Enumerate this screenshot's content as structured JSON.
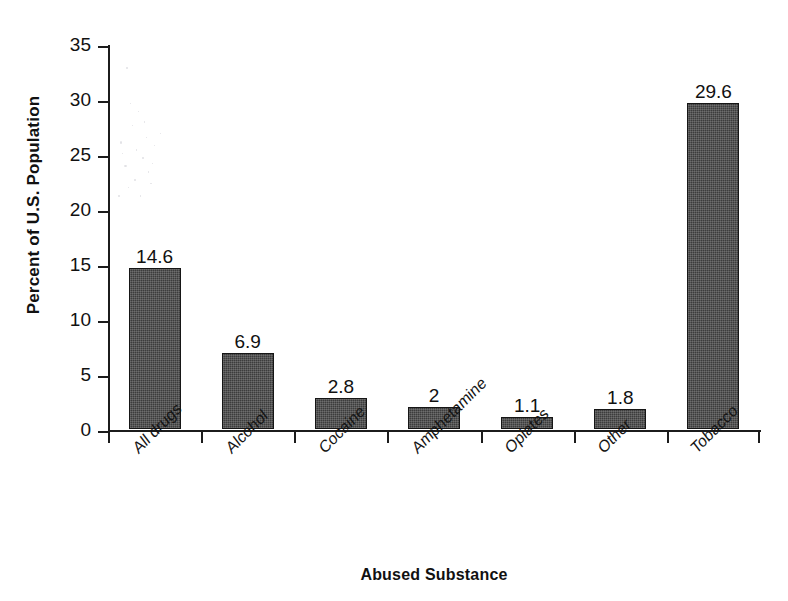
{
  "chart_data": {
    "type": "bar",
    "title": "",
    "xlabel": "Abused Substance",
    "ylabel": "Percent of U.S. Population",
    "categories": [
      "All drugs",
      "Alcohol",
      "Cocaine",
      "Amphetamine",
      "Opiates",
      "Other",
      "Tobacco"
    ],
    "values": [
      14.6,
      6.9,
      2.8,
      2,
      1.1,
      1.8,
      29.6
    ],
    "value_labels": [
      "14.6",
      "6.9",
      "2.8",
      "2",
      "1.1",
      "1.8",
      "29.6"
    ],
    "ylim": [
      0,
      35
    ],
    "ytick_labels": [
      "0",
      "5",
      "10",
      "15",
      "20",
      "25",
      "30",
      "35"
    ],
    "ytick_values": [
      0,
      5,
      10,
      15,
      20,
      25,
      30,
      35
    ],
    "grid": false,
    "legend": false,
    "bar_color": "#3c3c3c",
    "bar_edge_color": "#161616",
    "axis_color": "#1c1c1c",
    "background_color": "#ffffff",
    "xtick_boundaries": [
      0,
      1,
      2,
      3,
      4,
      5,
      6,
      7
    ]
  }
}
